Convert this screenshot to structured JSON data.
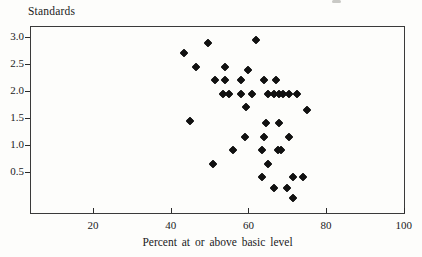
{
  "figure": {
    "y_axis_title": "Standards",
    "x_axis_title": "Percent at or above basic level",
    "background_color": "#fdfdfb",
    "axis_color": "#3a3a3a",
    "marker_color": "#111111",
    "marker_shape": "filled-diamond"
  },
  "chart_data": {
    "type": "scatter",
    "title": "",
    "xlabel": "Percent at or above basic level",
    "ylabel": "Standards",
    "grid": false,
    "legend": null,
    "xlim": [
      3.8,
      100.3
    ],
    "ylim": [
      -0.29,
      3.21
    ],
    "x_ticks": [
      20,
      40,
      60,
      80,
      100
    ],
    "x_tick_labels": [
      "20",
      "40",
      "60",
      "80",
      "100"
    ],
    "y_ticks": [
      3.0,
      2.5,
      2.0,
      1.5,
      1.0,
      0.5
    ],
    "y_tick_labels": [
      "3.0",
      "2.5",
      "2.0",
      "1.5",
      "1.0",
      "0.5"
    ],
    "points": [
      [
        49.5,
        2.9
      ],
      [
        62,
        2.95
      ],
      [
        43.5,
        2.7
      ],
      [
        46.5,
        2.45
      ],
      [
        54,
        2.45
      ],
      [
        60,
        2.4
      ],
      [
        51.5,
        2.2
      ],
      [
        54,
        2.2
      ],
      [
        58,
        2.2
      ],
      [
        64,
        2.2
      ],
      [
        67,
        2.2
      ],
      [
        53.5,
        1.95
      ],
      [
        55,
        1.95
      ],
      [
        58,
        1.95
      ],
      [
        61,
        1.95
      ],
      [
        65,
        1.95
      ],
      [
        66.5,
        1.95
      ],
      [
        68,
        1.95
      ],
      [
        69,
        1.95
      ],
      [
        70.5,
        1.95
      ],
      [
        72.5,
        1.95
      ],
      [
        59.5,
        1.7
      ],
      [
        75,
        1.65
      ],
      [
        45,
        1.45
      ],
      [
        64.5,
        1.4
      ],
      [
        68,
        1.4
      ],
      [
        59,
        1.15
      ],
      [
        64,
        1.15
      ],
      [
        70.5,
        1.15
      ],
      [
        56,
        0.9
      ],
      [
        63.5,
        0.9
      ],
      [
        67.5,
        0.9
      ],
      [
        68.5,
        0.9
      ],
      [
        51,
        0.65
      ],
      [
        65,
        0.65
      ],
      [
        63.5,
        0.4
      ],
      [
        71.5,
        0.4
      ],
      [
        74,
        0.4
      ],
      [
        66.5,
        0.2
      ],
      [
        70,
        0.2
      ],
      [
        71.5,
        0.0
      ]
    ]
  }
}
